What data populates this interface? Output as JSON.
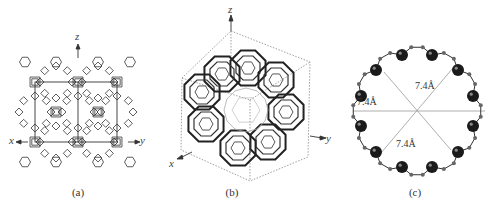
{
  "figure": {
    "panels": [
      {
        "id": "a",
        "caption": "(a)",
        "description": "Framework viewed along the projection, with Cartesian axes",
        "axes": {
          "z": "z",
          "x": "x",
          "y": "y"
        }
      },
      {
        "id": "b",
        "caption": "(b)",
        "description": "3D cage framework inside a dashed unit-cell cube",
        "axes": {
          "z": "z",
          "x": "x",
          "y": "y"
        }
      },
      {
        "id": "c",
        "caption": "(c)",
        "description": "12-membered ring aperture with diameters",
        "distances": [
          "7.4Å",
          "7.4Å",
          "7.4Å"
        ]
      }
    ]
  },
  "colors": {
    "line": "#333333",
    "atom": "#1a1a1a",
    "guide": "#999999",
    "background": "#ffffff"
  }
}
